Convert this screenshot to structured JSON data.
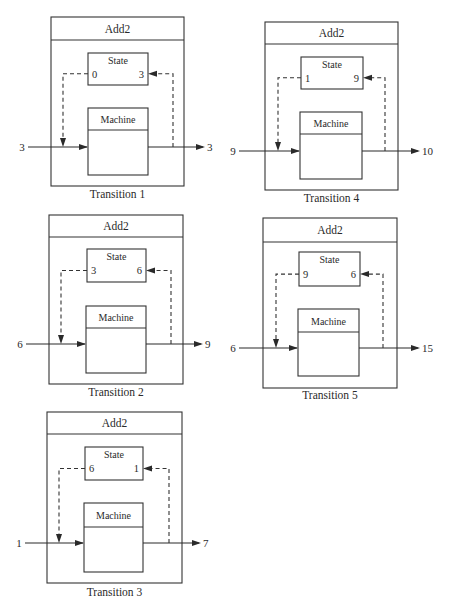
{
  "figure": {
    "colors": {
      "ink": "#2a2a2a",
      "background": "#ffffff"
    },
    "labels": {
      "outer_title": "Add2",
      "state_title": "State",
      "machine_title": "Machine"
    },
    "transitions": [
      {
        "caption": "Transition 1",
        "input": "3",
        "state_old": "0",
        "state_new": "3",
        "output": "3",
        "box": {
          "x": 51,
          "y": 17,
          "w": 133,
          "h": 169,
          "header_h": 23
        },
        "state_box": {
          "x": 88,
          "y": 53,
          "w": 60,
          "h": 32
        },
        "machine_box": {
          "x": 88,
          "y": 108,
          "w": 60,
          "h": 67,
          "header_h": 22
        },
        "arrow_y": 147,
        "left_dash_x": 63,
        "right_dash_x": 173,
        "input_label_x": 22,
        "output_end_x": 205,
        "caption_y": 198
      },
      {
        "caption": "Transition 2",
        "input": "6",
        "state_old": "3",
        "state_new": "6",
        "output": "9",
        "box": {
          "x": 49,
          "y": 215,
          "w": 134,
          "h": 169,
          "header_h": 22
        },
        "state_box": {
          "x": 87,
          "y": 249,
          "w": 59,
          "h": 33
        },
        "machine_box": {
          "x": 86,
          "y": 306,
          "w": 60,
          "h": 67,
          "header_h": 22
        },
        "arrow_y": 344,
        "left_dash_x": 61,
        "right_dash_x": 171,
        "input_label_x": 20,
        "output_end_x": 203,
        "caption_y": 396
      },
      {
        "caption": "Transition 3",
        "input": "1",
        "state_old": "6",
        "state_new": "1",
        "output": "7",
        "box": {
          "x": 47,
          "y": 412,
          "w": 135,
          "h": 171,
          "header_h": 22
        },
        "state_box": {
          "x": 85,
          "y": 447,
          "w": 58,
          "h": 33
        },
        "machine_box": {
          "x": 84,
          "y": 503,
          "w": 59,
          "h": 69,
          "header_h": 24
        },
        "arrow_y": 543,
        "left_dash_x": 59,
        "right_dash_x": 169,
        "input_label_x": 19,
        "output_end_x": 201,
        "caption_y": 596
      },
      {
        "caption": "Transition 4",
        "input": "9",
        "state_old": "1",
        "state_new": "9",
        "output": "10",
        "box": {
          "x": 265,
          "y": 22,
          "w": 133,
          "h": 168,
          "header_h": 22
        },
        "state_box": {
          "x": 301,
          "y": 57,
          "w": 62,
          "h": 32
        },
        "machine_box": {
          "x": 300,
          "y": 112,
          "w": 62,
          "h": 67,
          "header_h": 22
        },
        "arrow_y": 151,
        "left_dash_x": 278,
        "right_dash_x": 385,
        "input_label_x": 233,
        "output_end_x": 420,
        "caption_y": 202
      },
      {
        "caption": "Transition 5",
        "input": "6",
        "state_old": "9",
        "state_new": "6",
        "output": "15",
        "box": {
          "x": 263,
          "y": 218,
          "w": 134,
          "h": 170,
          "header_h": 24
        },
        "state_box": {
          "x": 299,
          "y": 252,
          "w": 61,
          "h": 34
        },
        "machine_box": {
          "x": 298,
          "y": 309,
          "w": 61,
          "h": 67,
          "header_h": 23
        },
        "arrow_y": 348,
        "left_dash_x": 276,
        "right_dash_x": 383,
        "input_label_x": 233,
        "output_end_x": 420,
        "caption_y": 399
      }
    ]
  }
}
